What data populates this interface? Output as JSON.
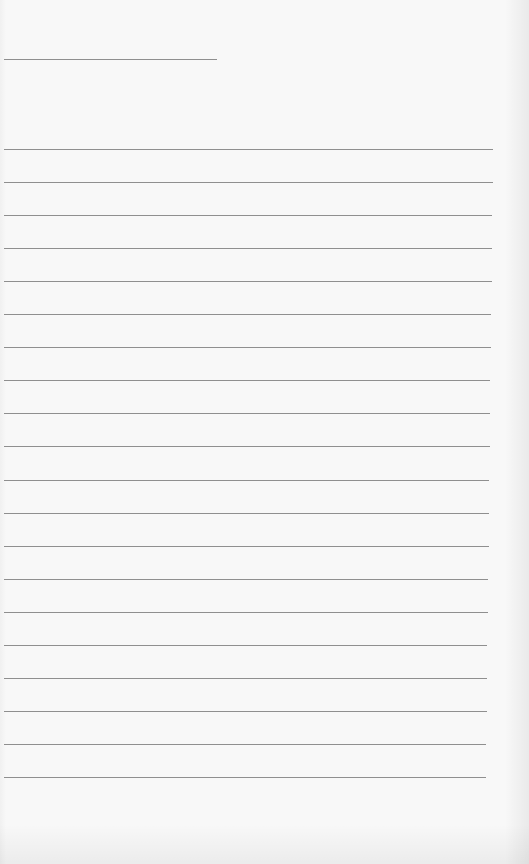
{
  "document": {
    "type": "lined-paper",
    "title_line": {
      "top": 59,
      "left": 4,
      "width": 213
    },
    "rules": {
      "count": 20,
      "first_top": 149,
      "spacing": 33.05,
      "left": 4,
      "right_start": 493,
      "right_end": 486
    },
    "line_color": "#8f8f8f",
    "paper_color": "#f8f8f8"
  }
}
